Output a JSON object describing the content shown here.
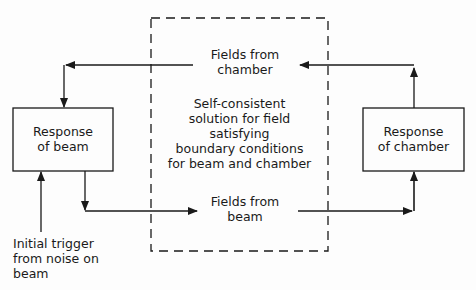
{
  "diagram": {
    "beam_box": {
      "label_line1": "Response",
      "label_line2": "of beam"
    },
    "chamber_box": {
      "label_line1": "Response",
      "label_line2": "of chamber"
    },
    "fields_from_chamber": {
      "line1": "Fields from",
      "line2": "chamber"
    },
    "fields_from_beam": {
      "line1": "Fields from",
      "line2": "beam"
    },
    "center_text": {
      "line1": "Self-consistent",
      "line2": "solution for field",
      "line3": "satisfying",
      "line4": "boundary conditions",
      "line5": "for beam and chamber"
    },
    "trigger": {
      "line1": "Initial trigger",
      "line2": "from noise on",
      "line3": "beam"
    },
    "colors": {
      "line": "#1a1a1a",
      "background": "#fdfdfd"
    }
  }
}
